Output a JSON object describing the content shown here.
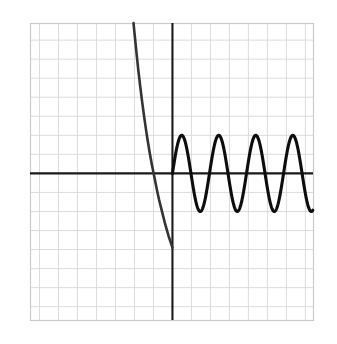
{
  "figure": {
    "width": 337,
    "height": 344,
    "background_color": "#ffffff",
    "title": "",
    "alt_label": "graph of a steeply decreasing curve and a periodic oscillation on a grid"
  },
  "chart_data": {
    "type": "line",
    "title": "",
    "subtitle": "",
    "xlabel": "",
    "ylabel": "",
    "grid": true,
    "grid_color": "#d8d8d8",
    "grid_spacing_units": 1,
    "legend": "none",
    "axis_color": "#1a1a1a",
    "curve_color": "#111111",
    "frame_color": "#cccccc",
    "xlim": [
      -7.5,
      7.4
    ],
    "ylim": [
      -7.7,
      7.9
    ],
    "xticks": [
      -7,
      -6,
      -5,
      -4,
      -3,
      -2,
      -1,
      0,
      1,
      2,
      3,
      4,
      5,
      6,
      7
    ],
    "yticks": [
      -7,
      -6,
      -5,
      -4,
      -3,
      -2,
      -1,
      0,
      1,
      2,
      3,
      4,
      5,
      6,
      7
    ],
    "xtick_labels": [],
    "ytick_labels": [],
    "series": [
      {
        "name": "decaying-branch",
        "description": "steeply decreasing curve from upper left to the y-axis",
        "domain": [
          -2.05,
          0.0
        ],
        "x": [
          -2.05,
          -2.0,
          -1.9,
          -1.8,
          -1.7,
          -1.6,
          -1.5,
          -1.4,
          -1.3,
          -1.2,
          -1.1,
          -1.0,
          -0.9,
          -0.8,
          -0.7,
          -0.6,
          -0.5,
          -0.4,
          -0.3,
          -0.2,
          -0.1,
          0.0
        ],
        "y": [
          7.9,
          7.4,
          6.4,
          5.45,
          4.6,
          3.8,
          3.05,
          2.35,
          1.7,
          1.1,
          0.55,
          0.05,
          -0.45,
          -0.95,
          -1.4,
          -1.8,
          -2.2,
          -2.6,
          -2.95,
          -3.3,
          -3.6,
          -3.9
        ],
        "x_intercept": -1.0,
        "endpoint": [
          0.0,
          -3.9
        ]
      },
      {
        "name": "oscillation",
        "description": "sinusoidal oscillation to the right of the y-axis",
        "domain": [
          0.0,
          7.4
        ],
        "amplitude": 2.0,
        "period": 1.95,
        "midline": 0.0,
        "phase_at_origin": 0.0,
        "peaks_x": [
          0.73,
          2.68,
          4.63,
          6.58
        ],
        "peak_y": 2.0,
        "troughs_x": [
          1.7,
          3.65,
          5.6,
          7.55
        ],
        "trough_y": -2.0,
        "zero_crossings_x": [
          0.0,
          1.22,
          2.19,
          3.17,
          4.14,
          5.11,
          6.09,
          7.06
        ]
      }
    ]
  },
  "axes": {
    "x_axis_label": "x-axis",
    "y_axis_label": "y-axis",
    "x_axis_position_px": 173,
    "y_axis_position_px": 172
  },
  "frame": {
    "left_px": 30,
    "top_px": 23,
    "right_px": 313,
    "bottom_px": 320
  }
}
